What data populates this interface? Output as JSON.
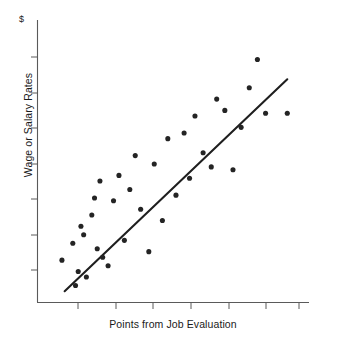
{
  "chart_data": {
    "type": "scatter",
    "title": "",
    "subtitle": "",
    "xlabel": "Points from Job Evaluation",
    "ylabel": "Wage or Salary Rates",
    "yaxis_unit_label": "$",
    "grid": false,
    "legend": null,
    "xlim": [
      0,
      100
    ],
    "ylim": [
      0,
      100
    ],
    "axis_tick_labels": {
      "x": [
        "",
        "",
        "",
        "",
        "",
        "",
        ""
      ],
      "y": [
        "",
        "",
        "",
        "",
        "",
        "",
        ""
      ]
    },
    "x_tick_positions": [
      13,
      26,
      39,
      52,
      65,
      78,
      91
    ],
    "y_tick_positions": [
      13,
      26,
      39,
      52,
      65,
      78,
      91
    ],
    "series": [
      {
        "name": "Job evaluation points vs pay",
        "marker": "filled-circle",
        "color": "#242424",
        "points": [
          [
            9,
            15
          ],
          [
            13,
            21
          ],
          [
            14,
            6
          ],
          [
            15,
            11
          ],
          [
            16,
            27
          ],
          [
            17,
            24
          ],
          [
            18,
            9
          ],
          [
            20,
            31
          ],
          [
            21,
            37
          ],
          [
            22,
            19
          ],
          [
            23,
            43
          ],
          [
            24,
            16
          ],
          [
            26,
            13
          ],
          [
            28,
            36
          ],
          [
            30,
            45
          ],
          [
            32,
            22
          ],
          [
            34,
            40
          ],
          [
            36,
            52
          ],
          [
            38,
            33
          ],
          [
            41,
            18
          ],
          [
            43,
            49
          ],
          [
            46,
            29
          ],
          [
            48,
            58
          ],
          [
            51,
            38
          ],
          [
            54,
            60
          ],
          [
            56,
            44
          ],
          [
            58,
            66
          ],
          [
            61,
            53
          ],
          [
            64,
            48
          ],
          [
            66,
            72
          ],
          [
            69,
            68
          ],
          [
            72,
            47
          ],
          [
            75,
            62
          ],
          [
            78,
            76
          ],
          [
            81,
            86
          ],
          [
            84,
            67
          ],
          [
            92,
            67
          ]
        ]
      }
    ],
    "trendline": {
      "name": "line of best fit",
      "color": "#1f1f1f",
      "start": [
        10,
        4
      ],
      "end": [
        92,
        79
      ]
    }
  }
}
